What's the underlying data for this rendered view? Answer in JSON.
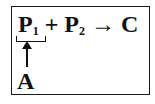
{
  "equation": {
    "p1": "P",
    "p1_sub": "1",
    "plus": "+",
    "p2": "P",
    "p2_sub": "2",
    "arrow": "→",
    "product": "C"
  },
  "annotation": {
    "label": "A"
  }
}
